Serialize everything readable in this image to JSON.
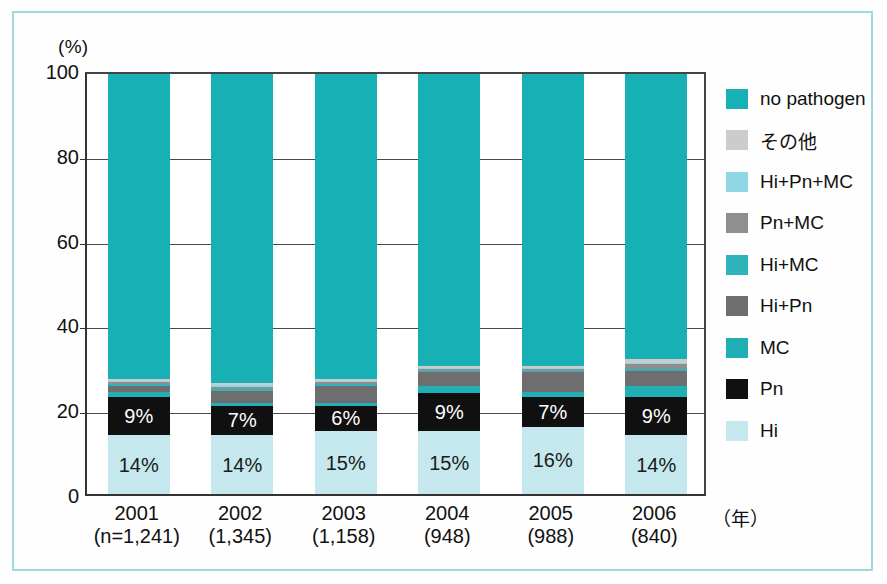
{
  "chart_data": {
    "type": "bar",
    "stacked": true,
    "stack_total": 100,
    "title": "",
    "subtitle": "",
    "xlabel": "（年）",
    "ylabel": "(%)",
    "ylim": [
      0,
      100
    ],
    "yticks": [
      "0",
      "20",
      "40",
      "60",
      "80",
      "100"
    ],
    "grid": true,
    "legend_position": "right",
    "categories": [
      "2001",
      "2002",
      "2003",
      "2004",
      "2005",
      "2006"
    ],
    "category_sublabels": [
      "(n=1,241)",
      "(1,345)",
      "(1,158)",
      "(948)",
      "(988)",
      "(840)"
    ],
    "series": [
      {
        "name": "Hi",
        "color": "#c5e8ef",
        "values": [
          14,
          14,
          15,
          15,
          16,
          14
        ],
        "labels": [
          "14%",
          "14%",
          "15%",
          "15%",
          "16%",
          "14%"
        ],
        "label_color": "dark"
      },
      {
        "name": "Pn",
        "color": "#101010",
        "values": [
          9,
          7,
          6,
          9,
          7,
          9
        ],
        "labels": [
          "9%",
          "7%",
          "6%",
          "9%",
          "7%",
          "9%"
        ],
        "label_color": "light"
      },
      {
        "name": "MC",
        "color": "#21afb6",
        "values": [
          1.2,
          0.6,
          0.6,
          1.6,
          1.4,
          2.6
        ],
        "labels": [
          "",
          "",
          "",
          "",
          "",
          ""
        ],
        "label_color": "dark"
      },
      {
        "name": "Hi+Pn",
        "color": "#6e6e6e",
        "values": [
          1.6,
          3.0,
          4.2,
          3.4,
          4.6,
          3.6
        ],
        "labels": [
          "",
          "",
          "",
          "",
          "",
          ""
        ],
        "label_color": "dark"
      },
      {
        "name": "Hi+MC",
        "color": "#2fb3bb",
        "values": [
          0.5,
          0.5,
          0.5,
          0.4,
          0.4,
          0.5
        ],
        "labels": [
          "",
          "",
          "",
          "",
          "",
          ""
        ],
        "label_color": "dark"
      },
      {
        "name": "Pn+MC",
        "color": "#8f8f8f",
        "values": [
          0.4,
          0.4,
          0.4,
          0.4,
          0.4,
          1.2
        ],
        "labels": [
          "",
          "",
          "",
          "",
          "",
          ""
        ],
        "label_color": "dark"
      },
      {
        "name": "Hi+Pn+MC",
        "color": "#8fd7e4",
        "values": [
          0.3,
          0.5,
          0.3,
          0.2,
          0.2,
          0.4
        ],
        "labels": [
          "",
          "",
          "",
          "",
          "",
          ""
        ],
        "label_color": "dark"
      },
      {
        "name": "その他",
        "color": "#cccccc",
        "values": [
          0.5,
          0.5,
          0.5,
          0.5,
          0.5,
          0.8
        ],
        "labels": [
          "",
          "",
          "",
          "",
          "",
          ""
        ],
        "label_color": "dark"
      },
      {
        "name": "no pathogen",
        "color": "#17b0b4",
        "values": [
          72.5,
          73.5,
          72.5,
          69.5,
          69.5,
          67.9
        ],
        "labels": [
          "",
          "",
          "",
          "",
          "",
          ""
        ],
        "label_color": "dark"
      }
    ],
    "legend": [
      {
        "label": "no pathogen",
        "color": "#17b0b4"
      },
      {
        "label": "その他",
        "color": "#cccccc"
      },
      {
        "label": "Hi+Pn+MC",
        "color": "#8fd7e4"
      },
      {
        "label": "Pn+MC",
        "color": "#8f8f8f"
      },
      {
        "label": "Hi+MC",
        "color": "#2fb3bb"
      },
      {
        "label": "Hi+Pn",
        "color": "#6e6e6e"
      },
      {
        "label": "MC",
        "color": "#21afb6"
      },
      {
        "label": "Pn",
        "color": "#101010"
      },
      {
        "label": "Hi",
        "color": "#c5e8ef"
      }
    ]
  },
  "frame": {
    "border_color": "#9fd9e0"
  }
}
